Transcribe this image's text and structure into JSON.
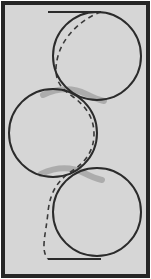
{
  "figure": {
    "canvas": {
      "width": 151,
      "height": 279
    },
    "colors": {
      "page_background": "#ffffff",
      "panel_fill": "#d6d6d6",
      "frame_stroke": "#262626",
      "curve_stroke": "#2b2b2b",
      "dashed_stroke": "#3a3a3a",
      "highlight_stroke": "#8a8a8a"
    },
    "frame": {
      "name": "outer-frame",
      "x": 3,
      "y": 3,
      "width": 145,
      "height": 273,
      "stroke_width": 4
    },
    "circles": [
      {
        "label": "top-circle",
        "cx": 97,
        "cy": 56,
        "r": 44,
        "stroke_width": 2
      },
      {
        "label": "middle-circle",
        "cx": 53,
        "cy": 133,
        "r": 44,
        "stroke_width": 2
      },
      {
        "label": "bottom-circle",
        "cx": 97,
        "cy": 212,
        "r": 44,
        "stroke_width": 2
      }
    ],
    "lines": [
      {
        "label": "top-baseline",
        "x1": 48,
        "y1": 12,
        "x2": 101,
        "y2": 12,
        "stroke_width": 2
      },
      {
        "label": "bottom-baseline",
        "x1": 48,
        "y1": 259,
        "x2": 101,
        "y2": 259,
        "stroke_width": 2
      }
    ],
    "dashed_curve": {
      "label": "cycloid-dashed-path",
      "dash_pattern": "5 4",
      "stroke_width": 1.6,
      "path": "M 101 12 C 84 18, 64 34, 58 56 C 52 78, 60 88, 72 96 C 86 106, 94 118, 94 134 C 94 150, 86 162, 72 171 C 58 180, 50 192, 48 212 C 46 234, 40 250, 48 259"
    },
    "highlights": [
      {
        "label": "upper-tangent-highlight",
        "path": "M 43 95 C 58 88, 72 87, 86 94 C 94 98, 99 100, 104 101",
        "stroke_width": 6,
        "opacity": 0.55
      },
      {
        "label": "lower-tangent-highlight",
        "path": "M 41 174 C 56 167, 70 166, 84 173 C 92 177, 97 179, 102 180",
        "stroke_width": 6,
        "opacity": 0.55
      }
    ]
  }
}
